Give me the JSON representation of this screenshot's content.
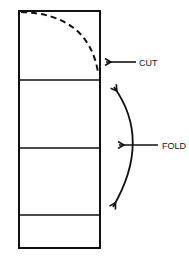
{
  "diagram": {
    "labels": {
      "cut": "CUT",
      "fold": "FOLD"
    },
    "panels": 4,
    "colors": {
      "stroke": "#111111",
      "background": "#ffffff"
    }
  }
}
